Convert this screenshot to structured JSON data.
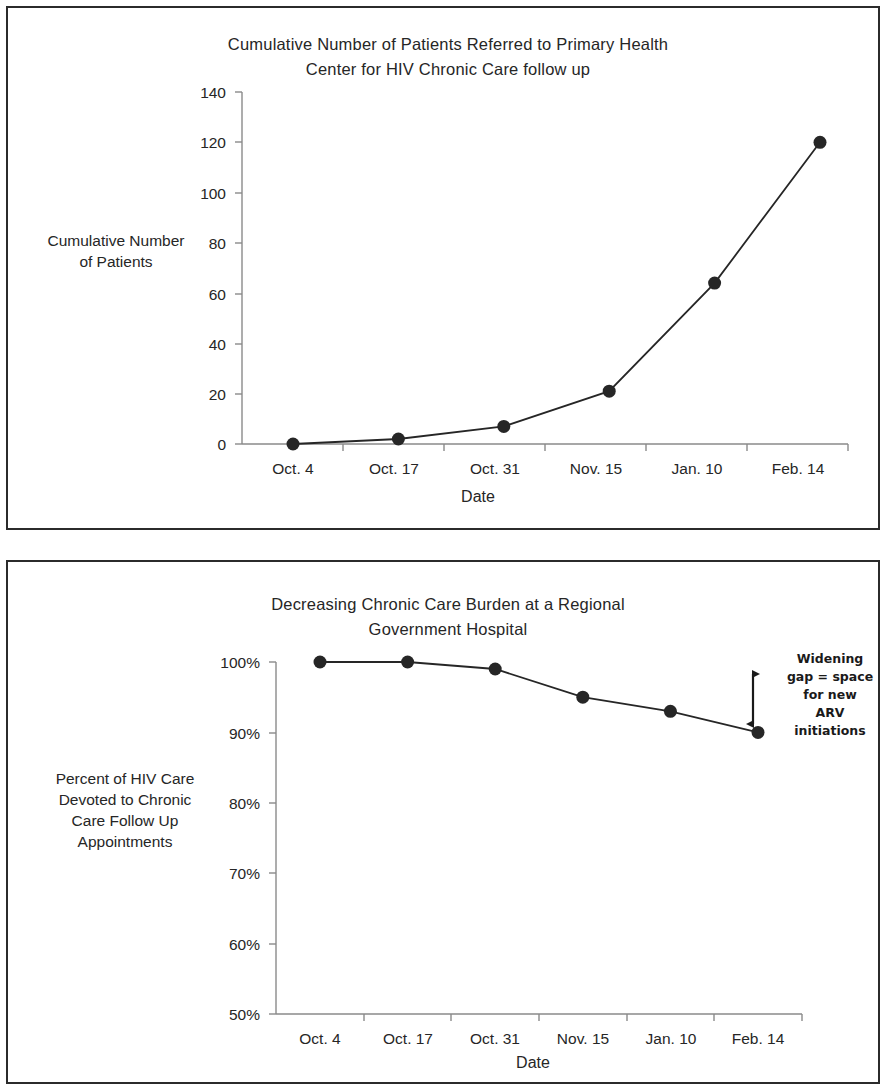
{
  "chart_data": [
    {
      "type": "line",
      "title": "Cumulative Number of Patients Referred to Primary Health Center for HIV Chronic Care follow up",
      "title_line1": "Cumulative Number of Patients Referred to Primary Health",
      "title_line2": "Center for HIV Chronic Care follow up",
      "xlabel": "Date",
      "ylabel": "Cumulative Number of Patients",
      "ylabel_line1": "Cumulative Number",
      "ylabel_line2": "of Patients",
      "categories": [
        "Oct. 4",
        "Oct. 17",
        "Oct. 31",
        "Nov. 15",
        "Jan. 10",
        "Feb. 14"
      ],
      "values": [
        0,
        2,
        7,
        21,
        64,
        120
      ],
      "ytick_labels": [
        "140",
        "120",
        "100",
        "80",
        "60",
        "40",
        "20",
        "0"
      ],
      "ytick_values": [
        140,
        120,
        100,
        80,
        60,
        40,
        20,
        0
      ],
      "ylim": [
        0,
        140
      ],
      "grid": false,
      "legend": "none",
      "marker": "filled-circle",
      "line_color": "#262626"
    },
    {
      "type": "line",
      "title": "Decreasing Chronic Care Burden at a Regional Government Hospital",
      "title_line1": "Decreasing Chronic Care Burden at a Regional",
      "title_line2": "Government Hospital",
      "xlabel": "Date",
      "ylabel": "Percent of HIV Care Devoted to Chronic Care Follow Up Appointments",
      "ylabel_line1": "Percent of HIV Care",
      "ylabel_line2": "Devoted to Chronic",
      "ylabel_line3": "Care Follow Up",
      "ylabel_line4": "Appointments",
      "categories": [
        "Oct. 4",
        "Oct. 17",
        "Oct. 31",
        "Nov. 15",
        "Jan. 10",
        "Feb. 14"
      ],
      "values": [
        100,
        100,
        99,
        95,
        93,
        90
      ],
      "ytick_labels": [
        "100%",
        "90%",
        "80%",
        "70%",
        "60%",
        "50%"
      ],
      "ytick_values": [
        100,
        90,
        80,
        70,
        60,
        50
      ],
      "ylim": [
        50,
        100
      ],
      "grid": false,
      "legend": "none",
      "marker": "filled-circle",
      "line_color": "#262626",
      "annotations": [
        {
          "name": "widening-gap-note",
          "text": "Widening gap = space for new ARV initiations",
          "line1": "Widening",
          "line2": "gap = space",
          "line3": "for new",
          "line4": "ARV",
          "line5": "initiations",
          "marker": "double-headed-vertical-arrow"
        }
      ]
    }
  ]
}
